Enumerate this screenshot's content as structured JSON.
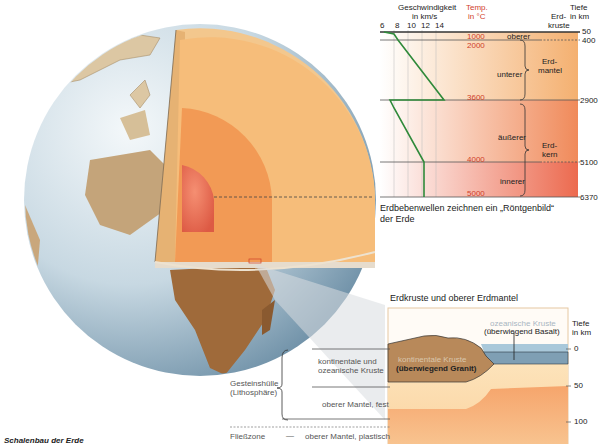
{
  "caption": "Schalenbau der Erde",
  "profile": {
    "velocity_header": [
      "Geschwindigkeit",
      "in km/s"
    ],
    "velocity_ticks": [
      "6",
      "8",
      "10",
      "12",
      "14"
    ],
    "temp_header": [
      "Temp.",
      "in °C"
    ],
    "crust_header": [
      "Erd-",
      "kruste"
    ],
    "depth_header": [
      "Tiefe",
      "in km"
    ],
    "depths": [
      "50",
      "400",
      "2900",
      "5100",
      "6370"
    ],
    "temperatures": [
      "1000",
      "2000",
      "3600",
      "4000",
      "5000"
    ],
    "layers": {
      "mantle_upper": "oberer",
      "mantle_lower": "unterer",
      "mantle_label": [
        "Erd-",
        "mantel"
      ],
      "core_outer": "äußerer",
      "core_inner": "innerer",
      "core_label": [
        "Erd-",
        "kern"
      ]
    },
    "caption": [
      "Erdbebenwellen zeichnen ein „Röntgenbild“",
      "der Erde"
    ]
  },
  "crust_detail": {
    "title": "Erdkruste und oberer Erdmantel",
    "oceanic": [
      "ozeanische Kruste",
      "(überwiegend Basalt)"
    ],
    "continental": [
      "kontinentale Kruste",
      "(überwiegend Granit)"
    ],
    "depth_header": [
      "Tiefe",
      "in km"
    ],
    "depth_ticks": [
      "0",
      "50",
      "100"
    ]
  },
  "legend": {
    "lithosphere": [
      "Gesteinshülle",
      "(Lithosphäre)"
    ],
    "crust": [
      "kontinentale und",
      "ozeanische Kruste"
    ],
    "upper_mantle_solid": "oberer Mantel, fest",
    "flow_zone": "Fließzone",
    "dash": "—",
    "upper_mantle_plastic": "oberer Mantel, plastisch"
  },
  "colors": {
    "velocity_line": "#2f8a3a",
    "temperature_text": "#d0402a",
    "ocean_blue": "#7f9fb4",
    "crust_brown": "#b8895a"
  }
}
